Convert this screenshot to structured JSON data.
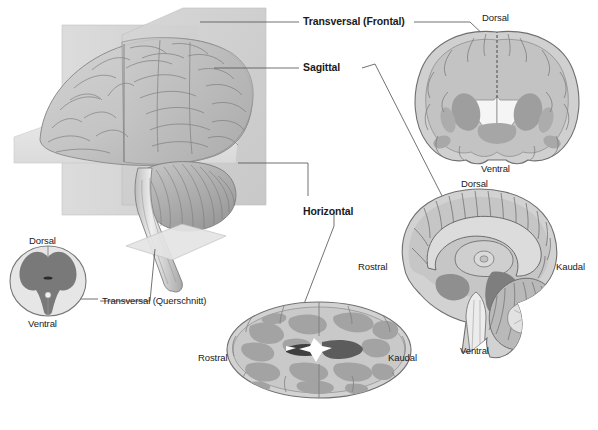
{
  "figure": {
    "background_color": "#ffffff",
    "line_color": "#595959",
    "text_color": "#1a1a1a"
  },
  "plane_labels": {
    "transversal_frontal": "Transversal (Frontal)",
    "sagittal": "Sagittal",
    "horizontal": "Horizontal",
    "transversal_querschnitt": "Transversal (Querschnitt)"
  },
  "spinal_cord": {
    "dorsal": "Dorsal",
    "ventral": "Ventral"
  },
  "coronal_section": {
    "dorsal": "Dorsal",
    "ventral": "Ventral"
  },
  "midsagittal_section": {
    "dorsal": "Dorsal",
    "ventral": "Ventral",
    "rostral": "Rostral",
    "kaudal": "Kaudal"
  },
  "horizontal_section": {
    "rostral": "Rostral",
    "kaudal": "Kaudal"
  },
  "colors": {
    "plane_fill": "#d9d9d9",
    "plane_fill_light": "#e6e6e6",
    "brain_fill": "#c9c9c9",
    "brain_fill_dark": "#b3b3b3",
    "gray_matter": "#9b9b9b",
    "dark_matter": "#7a7a7a",
    "outline": "#6b6b6b",
    "white_fill": "#f2f2f2",
    "leader_line": "#595959"
  }
}
